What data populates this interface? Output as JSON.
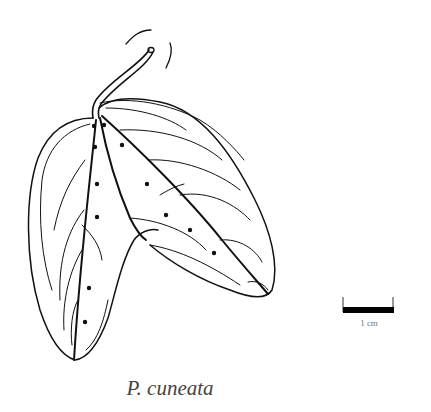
{
  "figure": {
    "caption": "P. cuneata",
    "scale_bar": {
      "label": "1 cm",
      "color": "#000000"
    },
    "line_color": "#111111",
    "background": "#ffffff"
  }
}
